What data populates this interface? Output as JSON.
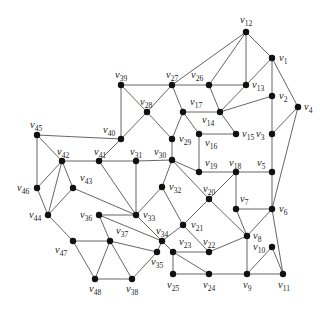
{
  "diagram": {
    "type": "graph",
    "node_color": "#111111",
    "edge_color": "#555555",
    "nodes": [
      {
        "id": "v1",
        "x": 272,
        "y": 58,
        "lx": 279,
        "ly": 61,
        "label": "v",
        "sub": "1"
      },
      {
        "id": "v2",
        "x": 272,
        "y": 96,
        "lx": 279,
        "ly": 99,
        "label": "v",
        "sub": "2"
      },
      {
        "id": "v3",
        "x": 272,
        "y": 134,
        "lx": 256,
        "ly": 137,
        "label": "v",
        "sub": "3"
      },
      {
        "id": "v4",
        "x": 298,
        "y": 107,
        "lx": 304,
        "ly": 110,
        "label": "v",
        "sub": "4"
      },
      {
        "id": "v5",
        "x": 272,
        "y": 172,
        "lx": 257,
        "ly": 166,
        "label": "v",
        "sub": "5"
      },
      {
        "id": "v6",
        "x": 272,
        "y": 209,
        "lx": 279,
        "ly": 212,
        "label": "v",
        "sub": "6"
      },
      {
        "id": "v7",
        "x": 236,
        "y": 209,
        "lx": 240,
        "ly": 202,
        "label": "v",
        "sub": "7"
      },
      {
        "id": "v8",
        "x": 247,
        "y": 236,
        "lx": 253,
        "ly": 239,
        "label": "v",
        "sub": "8"
      },
      {
        "id": "v9",
        "x": 247,
        "y": 274,
        "lx": 243,
        "ly": 288,
        "label": "v",
        "sub": "9"
      },
      {
        "id": "v10",
        "x": 272,
        "y": 247,
        "lx": 253,
        "ly": 250,
        "label": "v",
        "sub": "10"
      },
      {
        "id": "v11",
        "x": 283,
        "y": 274,
        "lx": 278,
        "ly": 288,
        "label": "v",
        "sub": "11"
      },
      {
        "id": "v12",
        "x": 246,
        "y": 32,
        "lx": 240,
        "ly": 23,
        "label": "v",
        "sub": "12"
      },
      {
        "id": "v13",
        "x": 246,
        "y": 85,
        "lx": 252,
        "ly": 88,
        "label": "v",
        "sub": "13"
      },
      {
        "id": "v14",
        "x": 220,
        "y": 112,
        "lx": 202,
        "ly": 123,
        "label": "v",
        "sub": "14"
      },
      {
        "id": "v15",
        "x": 236,
        "y": 134,
        "lx": 242,
        "ly": 137,
        "label": "v",
        "sub": "15"
      },
      {
        "id": "v16",
        "x": 199,
        "y": 134,
        "lx": 205,
        "ly": 146,
        "label": "v",
        "sub": "16"
      },
      {
        "id": "v17",
        "x": 183,
        "y": 112,
        "lx": 190,
        "ly": 105,
        "label": "v",
        "sub": "17"
      },
      {
        "id": "v18",
        "x": 236,
        "y": 172,
        "lx": 229,
        "ly": 166,
        "label": "v",
        "sub": "18"
      },
      {
        "id": "v19",
        "x": 199,
        "y": 172,
        "lx": 205,
        "ly": 166,
        "label": "v",
        "sub": "19"
      },
      {
        "id": "v20",
        "x": 209,
        "y": 199,
        "lx": 203,
        "ly": 192,
        "label": "v",
        "sub": "20"
      },
      {
        "id": "v21",
        "x": 183,
        "y": 225,
        "lx": 191,
        "ly": 228,
        "label": "v",
        "sub": "21"
      },
      {
        "id": "v22",
        "x": 209,
        "y": 252,
        "lx": 203,
        "ly": 245,
        "label": "v",
        "sub": "22"
      },
      {
        "id": "v23",
        "x": 173,
        "y": 252,
        "lx": 179,
        "ly": 245,
        "label": "v",
        "sub": "23"
      },
      {
        "id": "v24",
        "x": 209,
        "y": 274,
        "lx": 203,
        "ly": 288,
        "label": "v",
        "sub": "24"
      },
      {
        "id": "v25",
        "x": 173,
        "y": 274,
        "lx": 167,
        "ly": 288,
        "label": "v",
        "sub": "25"
      },
      {
        "id": "v26",
        "x": 209,
        "y": 85,
        "lx": 191,
        "ly": 78,
        "label": "v",
        "sub": "26"
      },
      {
        "id": "v27",
        "x": 172,
        "y": 85,
        "lx": 166,
        "ly": 78,
        "label": "v",
        "sub": "27"
      },
      {
        "id": "v28",
        "x": 147,
        "y": 112,
        "lx": 140,
        "ly": 105,
        "label": "v",
        "sub": "28"
      },
      {
        "id": "v29",
        "x": 172,
        "y": 139,
        "lx": 179,
        "ly": 142,
        "label": "v",
        "sub": "29"
      },
      {
        "id": "v30",
        "x": 172,
        "y": 160,
        "lx": 154,
        "ly": 155,
        "label": "v",
        "sub": "30"
      },
      {
        "id": "v31",
        "x": 136,
        "y": 161,
        "lx": 130,
        "ly": 155,
        "label": "v",
        "sub": "31"
      },
      {
        "id": "v32",
        "x": 162,
        "y": 187,
        "lx": 169,
        "ly": 190,
        "label": "v",
        "sub": "32"
      },
      {
        "id": "v33",
        "x": 136,
        "y": 215,
        "lx": 143,
        "ly": 218,
        "label": "v",
        "sub": "33"
      },
      {
        "id": "v34",
        "x": 162,
        "y": 241,
        "lx": 156,
        "ly": 234,
        "label": "v",
        "sub": "34"
      },
      {
        "id": "v35",
        "x": 157,
        "y": 252,
        "lx": 151,
        "ly": 265,
        "label": "v",
        "sub": "35"
      },
      {
        "id": "v36",
        "x": 99,
        "y": 215,
        "lx": 80,
        "ly": 218,
        "label": "v",
        "sub": "36"
      },
      {
        "id": "v37",
        "x": 110,
        "y": 241,
        "lx": 116,
        "ly": 234,
        "label": "v",
        "sub": "37"
      },
      {
        "id": "v38",
        "x": 132,
        "y": 279,
        "lx": 126,
        "ly": 292,
        "label": "v",
        "sub": "38"
      },
      {
        "id": "v39",
        "x": 121,
        "y": 85,
        "lx": 115,
        "ly": 78,
        "label": "v",
        "sub": "39"
      },
      {
        "id": "v40",
        "x": 121,
        "y": 139,
        "lx": 103,
        "ly": 133,
        "label": "v",
        "sub": "40"
      },
      {
        "id": "v41",
        "x": 99,
        "y": 161,
        "lx": 94,
        "ly": 155,
        "label": "v",
        "sub": "41"
      },
      {
        "id": "v42",
        "x": 62,
        "y": 161,
        "lx": 57,
        "ly": 155,
        "label": "v",
        "sub": "42"
      },
      {
        "id": "v43",
        "x": 73,
        "y": 188,
        "lx": 80,
        "ly": 181,
        "label": "v",
        "sub": "43"
      },
      {
        "id": "v44",
        "x": 48,
        "y": 215,
        "lx": 29,
        "ly": 218,
        "label": "v",
        "sub": "44"
      },
      {
        "id": "v45",
        "x": 37,
        "y": 135,
        "lx": 30,
        "ly": 128,
        "label": "v",
        "sub": "45"
      },
      {
        "id": "v46",
        "x": 37,
        "y": 188,
        "lx": 17,
        "ly": 191,
        "label": "v",
        "sub": "46"
      },
      {
        "id": "v47",
        "x": 73,
        "y": 241,
        "lx": 55,
        "ly": 253,
        "label": "v",
        "sub": "47"
      },
      {
        "id": "v48",
        "x": 95,
        "y": 279,
        "lx": 89,
        "ly": 292,
        "label": "v",
        "sub": "48"
      }
    ],
    "edges": [
      [
        "v12",
        "v27"
      ],
      [
        "v12",
        "v26"
      ],
      [
        "v12",
        "v13"
      ],
      [
        "v12",
        "v1"
      ],
      [
        "v1",
        "v13"
      ],
      [
        "v1",
        "v2"
      ],
      [
        "v1",
        "v4"
      ],
      [
        "v39",
        "v27"
      ],
      [
        "v27",
        "v26"
      ],
      [
        "v26",
        "v13"
      ],
      [
        "v27",
        "v28"
      ],
      [
        "v27",
        "v17"
      ],
      [
        "v26",
        "v14"
      ],
      [
        "v13",
        "v14"
      ],
      [
        "v2",
        "v14"
      ],
      [
        "v2",
        "v3"
      ],
      [
        "v4",
        "v3"
      ],
      [
        "v4",
        "v6"
      ],
      [
        "v17",
        "v14"
      ],
      [
        "v17",
        "v29"
      ],
      [
        "v17",
        "v16"
      ],
      [
        "v14",
        "v15"
      ],
      [
        "v16",
        "v15"
      ],
      [
        "v16",
        "v19"
      ],
      [
        "v28",
        "v39"
      ],
      [
        "v28",
        "v40"
      ],
      [
        "v28",
        "v29"
      ],
      [
        "v39",
        "v40"
      ],
      [
        "v29",
        "v30"
      ],
      [
        "v30",
        "v31"
      ],
      [
        "v30",
        "v19"
      ],
      [
        "v30",
        "v32"
      ],
      [
        "v30",
        "v20"
      ],
      [
        "v19",
        "v18"
      ],
      [
        "v18",
        "v5"
      ],
      [
        "v3",
        "v5"
      ],
      [
        "v5",
        "v6"
      ],
      [
        "v18",
        "v7"
      ],
      [
        "v18",
        "v20"
      ],
      [
        "v7",
        "v6"
      ],
      [
        "v7",
        "v8"
      ],
      [
        "v20",
        "v21"
      ],
      [
        "v20",
        "v8"
      ],
      [
        "v6",
        "v8"
      ],
      [
        "v6",
        "v11"
      ],
      [
        "v8",
        "v9"
      ],
      [
        "v8",
        "v22"
      ],
      [
        "v10",
        "v9"
      ],
      [
        "v10",
        "v11"
      ],
      [
        "v9",
        "v11"
      ],
      [
        "v24",
        "v9"
      ],
      [
        "v25",
        "v24"
      ],
      [
        "v21",
        "v22"
      ],
      [
        "v21",
        "v34"
      ],
      [
        "v32",
        "v21"
      ],
      [
        "v32",
        "v33"
      ],
      [
        "v31",
        "v33"
      ],
      [
        "v41",
        "v33"
      ],
      [
        "v41",
        "v40"
      ],
      [
        "v41",
        "v42"
      ],
      [
        "v41",
        "v31"
      ],
      [
        "v45",
        "v40"
      ],
      [
        "v45",
        "v42"
      ],
      [
        "v45",
        "v46"
      ],
      [
        "v42",
        "v46"
      ],
      [
        "v42",
        "v44"
      ],
      [
        "v42",
        "v43"
      ],
      [
        "v46",
        "v44"
      ],
      [
        "v43",
        "v44"
      ],
      [
        "v43",
        "v33"
      ],
      [
        "v36",
        "v33"
      ],
      [
        "v36",
        "v37"
      ],
      [
        "v36",
        "v34"
      ],
      [
        "v44",
        "v47"
      ],
      [
        "v47",
        "v37"
      ],
      [
        "v47",
        "v48"
      ],
      [
        "v37",
        "v48"
      ],
      [
        "v37",
        "v38"
      ],
      [
        "v37",
        "v35"
      ],
      [
        "v48",
        "v38"
      ],
      [
        "v38",
        "v35"
      ],
      [
        "v35",
        "v34"
      ],
      [
        "v34",
        "v23"
      ],
      [
        "v33",
        "v34"
      ],
      [
        "v23",
        "v22"
      ],
      [
        "v23",
        "v25"
      ],
      [
        "v23",
        "v24"
      ]
    ]
  }
}
